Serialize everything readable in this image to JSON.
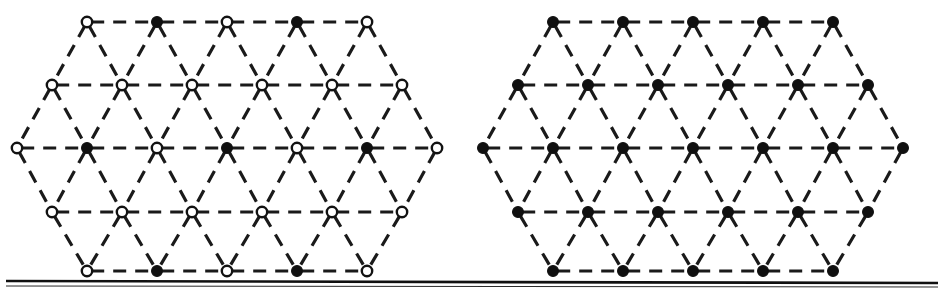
{
  "figure": {
    "background_color": "#ffffff",
    "line_color": "#101010",
    "node_open_fill": "#ffffff",
    "node_filled_fill": "#101010",
    "width": 943,
    "height": 297,
    "edge_style": "dashed",
    "dash_pattern": "13 9",
    "lattice_type": "triangular",
    "rows_per_panel": 5,
    "nodes_per_row": [
      5,
      6,
      7,
      6,
      5
    ],
    "row_y": [
      22,
      85,
      148,
      212,
      271
    ],
    "node_spacing_x": 70,
    "node_spacing_y": 63,
    "node_radius_open": 5.2,
    "node_radius_filled": 5.4
  },
  "baseline": {
    "label": "substrate-baseline",
    "y": 281,
    "x_start": 6,
    "x_end": 938,
    "color": "#101010",
    "thickness": 2.6
  },
  "panels": [
    {
      "id": "left-panel",
      "name": "ordered-sublattice-panel",
      "caption": "",
      "origin_x": 17,
      "description": "Triangular lattice with alternating open and filled sites forming an ordered pattern",
      "rows": [
        {
          "index": 0,
          "y": 22,
          "x_start": 87,
          "count": 5,
          "states": [
            "open",
            "filled",
            "open",
            "filled",
            "open"
          ]
        },
        {
          "index": 1,
          "y": 85,
          "x_start": 52,
          "count": 6,
          "states": [
            "open",
            "open",
            "open",
            "open",
            "open",
            "open"
          ]
        },
        {
          "index": 2,
          "y": 148,
          "x_start": 17,
          "count": 7,
          "states": [
            "open",
            "filled",
            "open",
            "filled",
            "open",
            "filled",
            "open"
          ]
        },
        {
          "index": 3,
          "y": 212,
          "x_start": 52,
          "count": 6,
          "states": [
            "open",
            "open",
            "open",
            "open",
            "open",
            "open"
          ]
        },
        {
          "index": 4,
          "y": 271,
          "x_start": 87,
          "count": 5,
          "states": [
            "open",
            "filled",
            "open",
            "filled",
            "open"
          ]
        }
      ]
    },
    {
      "id": "right-panel",
      "name": "fully-occupied-panel",
      "caption": "",
      "origin_x": 483,
      "description": "Triangular lattice with every site filled",
      "rows": [
        {
          "index": 0,
          "y": 22,
          "x_start": 553,
          "count": 5,
          "states": [
            "filled",
            "filled",
            "filled",
            "filled",
            "filled"
          ]
        },
        {
          "index": 1,
          "y": 85,
          "x_start": 518,
          "count": 6,
          "states": [
            "filled",
            "filled",
            "filled",
            "filled",
            "filled",
            "filled"
          ]
        },
        {
          "index": 2,
          "y": 148,
          "x_start": 483,
          "count": 7,
          "states": [
            "filled",
            "filled",
            "filled",
            "filled",
            "filled",
            "filled",
            "filled"
          ]
        },
        {
          "index": 3,
          "y": 212,
          "x_start": 518,
          "count": 6,
          "states": [
            "filled",
            "filled",
            "filled",
            "filled",
            "filled",
            "filled"
          ]
        },
        {
          "index": 4,
          "y": 271,
          "x_start": 553,
          "count": 5,
          "states": [
            "filled",
            "filled",
            "filled",
            "filled",
            "filled"
          ]
        }
      ]
    }
  ],
  "legend": {
    "open_site_label": "open site",
    "filled_site_label": "occupied site"
  }
}
